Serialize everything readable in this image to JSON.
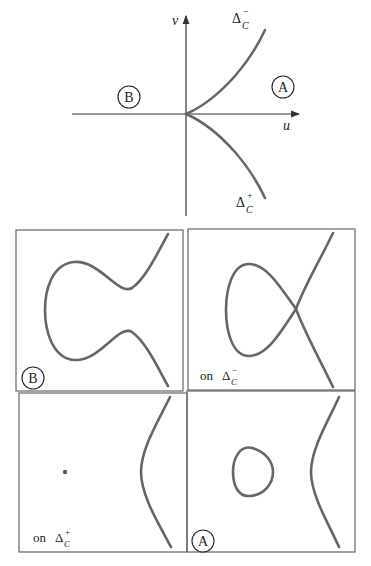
{
  "top_diagram": {
    "axis_u_label": "u",
    "axis_v_label": "v",
    "region_B_label": "B",
    "region_A_label": "A",
    "branch_upper": {
      "delta": "Δ",
      "sup": "−",
      "sub": "C"
    },
    "branch_lower": {
      "delta": "Δ",
      "sup": "+",
      "sub": "C"
    }
  },
  "panels": [
    {
      "id": "top-left",
      "label": "B",
      "label_style": "circled",
      "description": "single connected curve with two bumps (region B)"
    },
    {
      "id": "top-right",
      "prefix": "on ",
      "delta": "Δ",
      "sup": "−",
      "sub": "C",
      "description": "nodal curve with loop and crossing (on Δ_C^-)"
    },
    {
      "id": "bottom-left",
      "prefix": "on ",
      "delta": "Δ",
      "sup": "+",
      "sub": "C",
      "description": "isolated point plus unbounded branch (on Δ_C^+)"
    },
    {
      "id": "bottom-right",
      "label": "A",
      "label_style": "circled",
      "description": "oval plus unbounded branch (region A)"
    }
  ],
  "colors": {
    "curve": "#666666",
    "axis": "#333333",
    "frame": "#666666"
  }
}
